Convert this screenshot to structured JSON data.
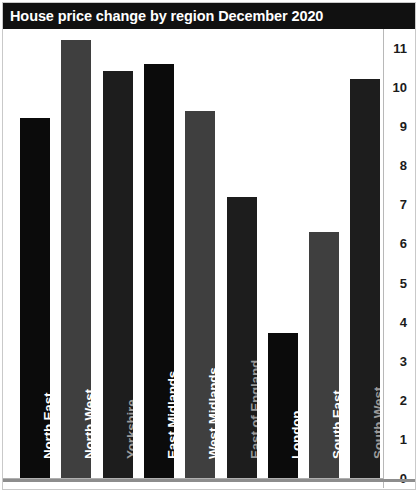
{
  "header": {
    "title": "House price change by region December 2020"
  },
  "colors": {
    "title_bar_bg": "#111111",
    "title_text": "#ffffff",
    "bar_black": "#0b0b0b",
    "bar_dark": "#1d1d1d",
    "bar_gray": "#3f3f3f",
    "label_light": "#ffffff",
    "label_dim": "#9a9a9a",
    "axis_text": "#1b1b1b",
    "page_bg": "#ffffff",
    "frame": "#c9c9c9"
  },
  "chart_data": {
    "type": "bar",
    "title": "House price change by region December 2020",
    "xlabel": "",
    "ylabel": "",
    "ylim": [
      0,
      11
    ],
    "grid": false,
    "legend": null,
    "y_axis_position": "right",
    "y_ticks": [
      11,
      10,
      9,
      8,
      7,
      6,
      5,
      4,
      3,
      2,
      1,
      0
    ],
    "y_tick_labels": [
      "11",
      "10",
      "9",
      "8",
      "7",
      "6",
      "5",
      "4",
      "3",
      "2",
      "1",
      "0"
    ],
    "categories": [
      "North East",
      "North West",
      "Yorkshire",
      "East Midlands",
      "West Midlands",
      "East of England",
      "London",
      "South East",
      "South West"
    ],
    "values": [
      9.2,
      11.2,
      10.4,
      10.6,
      9.4,
      7.2,
      3.7,
      6.3,
      10.2
    ],
    "bar_colors": [
      "#0b0b0b",
      "#3f3f3f",
      "#1d1d1d",
      "#0b0b0b",
      "#3f3f3f",
      "#1d1d1d",
      "#0b0b0b",
      "#3f3f3f",
      "#1d1d1d"
    ],
    "bar_label_colors": [
      "#ffffff",
      "#ffffff",
      "#9a9a9a",
      "#ffffff",
      "#ffffff",
      "#9a9a9a",
      "#ffffff",
      "#ffffff",
      "#9a9a9a"
    ]
  }
}
